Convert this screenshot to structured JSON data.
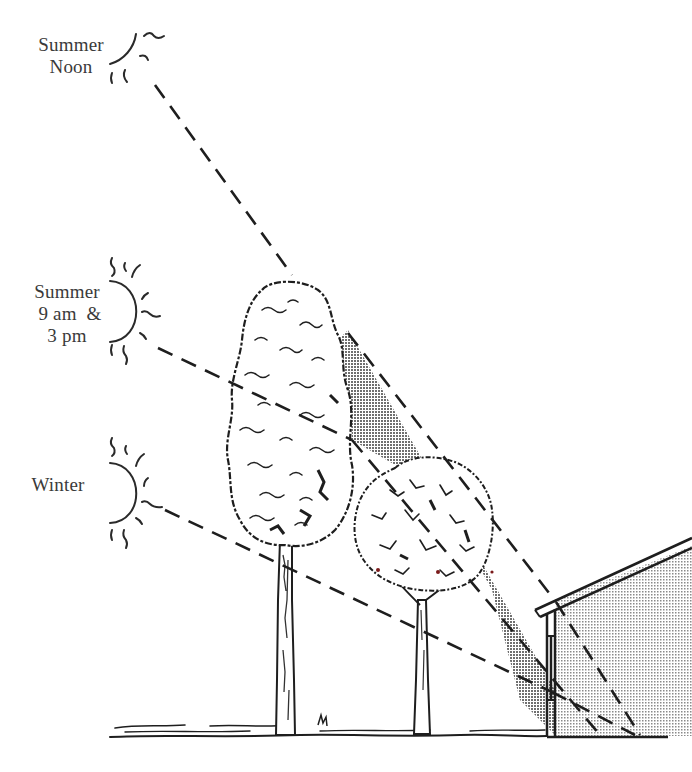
{
  "diagram": {
    "suns": [
      {
        "id": "summer-noon",
        "label_lines": [
          "Summer",
          "Noon"
        ]
      },
      {
        "id": "summer-9am-3pm",
        "label_lines": [
          "Summer",
          "9 am  &",
          "3 pm"
        ]
      },
      {
        "id": "winter",
        "label_lines": [
          "Winter"
        ]
      }
    ],
    "elements": {
      "tall_tree": "tall narrow deciduous tree",
      "short_tree": "smaller rounded deciduous tree",
      "house": "house wall with sloped roof and window",
      "ground": "ground line",
      "shadow": "stippled shaded region"
    },
    "colors": {
      "ink": "#1e1e1e",
      "label": "#3a3a3a",
      "shade_dark": "#9a9a9a",
      "shade_light": "#cfcfcf",
      "background": "#ffffff"
    }
  }
}
